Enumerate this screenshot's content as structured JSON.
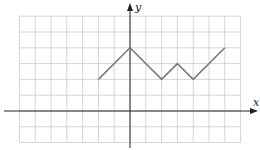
{
  "chart_data": {
    "type": "line",
    "title": "",
    "xlabel": "x",
    "ylabel": "y",
    "xlim": [
      -7,
      7
    ],
    "ylim": [
      -2,
      6
    ],
    "grid": true,
    "x": [
      -2,
      0,
      2,
      3,
      4,
      6
    ],
    "series": [
      {
        "name": "graph",
        "values": [
          2,
          4,
          2,
          3,
          2,
          4
        ]
      }
    ],
    "colors": {
      "line": "#777777",
      "grid": "#cccccc",
      "axis": "#222222"
    }
  },
  "labels": {
    "x_axis": "x",
    "y_axis": "y"
  }
}
